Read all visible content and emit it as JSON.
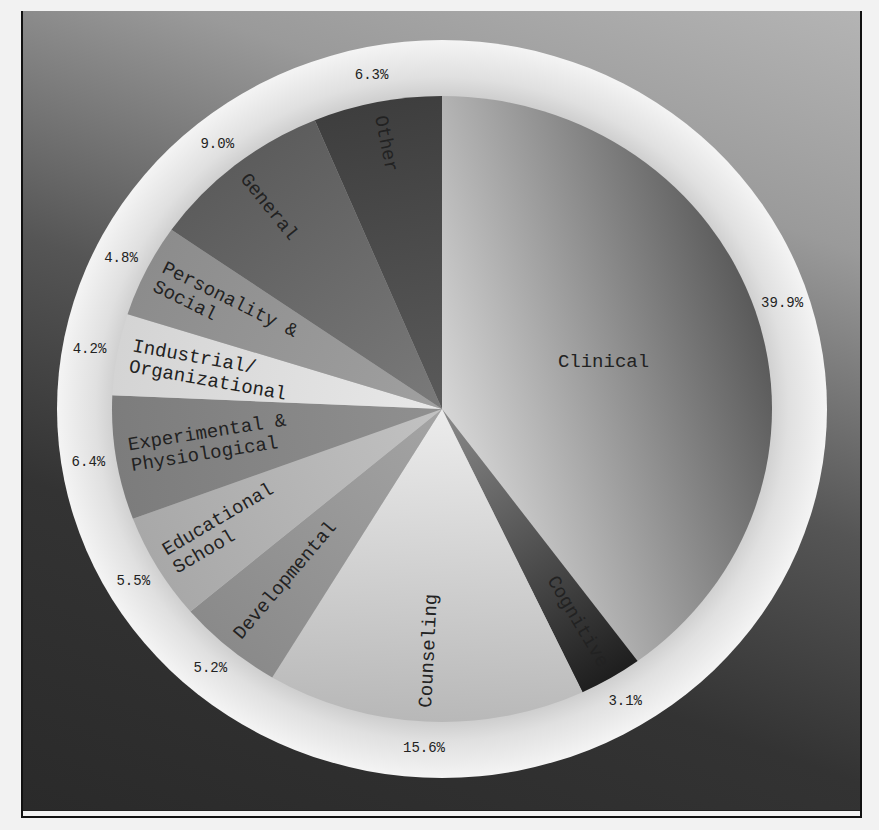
{
  "chart_data": {
    "type": "pie",
    "title": "",
    "start_angle_deg": 0,
    "direction": "clockwise",
    "categories": [
      "Clinical",
      "Cognitive",
      "Counseling",
      "Developmental",
      "Educational & School",
      "Experimental & Physiological",
      "Industrial/ Organizational",
      "Personality & Social",
      "General",
      "Other"
    ],
    "values": [
      39.9,
      3.1,
      15.6,
      5.2,
      5.5,
      6.4,
      4.2,
      4.8,
      9.0,
      6.3
    ],
    "value_labels": [
      "39.9%",
      "3.1%",
      "15.6%",
      "5.2%",
      "5.5%",
      "6.4%",
      "4.2%",
      "4.8%",
      "9.0%",
      "6.3%"
    ],
    "legend": "none (labels drawn on slices)"
  },
  "slices": [
    {
      "label_lines": [
        "Clinical"
      ],
      "pct": "39.9%",
      "value": 39.9,
      "light": "#d6d6d6",
      "dark": "#5a5a5a"
    },
    {
      "label_lines": [
        "Cognitive"
      ],
      "pct": "3.1%",
      "value": 3.1,
      "light": "#8a8a8a",
      "dark": "#1e1e1e"
    },
    {
      "label_lines": [
        "Counseling"
      ],
      "pct": "15.6%",
      "value": 15.6,
      "light": "#ececec",
      "dark": "#b8b8b8"
    },
    {
      "label_lines": [
        "Developmental"
      ],
      "pct": "5.2%",
      "value": 5.2,
      "light": "#a4a4a4",
      "dark": "#8a8a8a"
    },
    {
      "label_lines": [
        "Educational",
        "School"
      ],
      "pct": "5.5%",
      "value": 5.5,
      "light": "#c2c2c2",
      "dark": "#a8a8a8"
    },
    {
      "label_lines": [
        "Experimental &",
        "Physiological"
      ],
      "pct": "6.4%",
      "value": 6.4,
      "light": "#909090",
      "dark": "#7c7c7c"
    },
    {
      "label_lines": [
        "Industrial/",
        "Organizational"
      ],
      "pct": "4.2%",
      "value": 4.2,
      "light": "#e8e8e8",
      "dark": "#d4d4d4"
    },
    {
      "label_lines": [
        "Personality &",
        "Social"
      ],
      "pct": "4.8%",
      "value": 4.8,
      "light": "#a0a0a0",
      "dark": "#8c8c8c"
    },
    {
      "label_lines": [
        "General"
      ],
      "pct": "9.0%",
      "value": 9.0,
      "light": "#7a7a7a",
      "dark": "#5c5c5c"
    },
    {
      "label_lines": [
        "Other"
      ],
      "pct": "6.3%",
      "value": 6.3,
      "light": "#5a5a5a",
      "dark": "#3e3e3e"
    }
  ],
  "geometry": {
    "cx": 419,
    "cy": 398,
    "pie_rx": 330,
    "pie_ry": 313,
    "ring_rx": 385,
    "ring_ry": 369
  }
}
